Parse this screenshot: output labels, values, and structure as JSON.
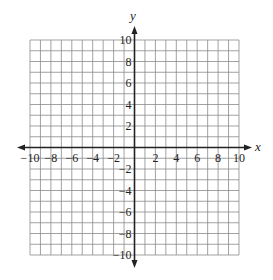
{
  "chart_data": {
    "type": "coordinate-grid",
    "title": "",
    "xlabel": "x",
    "ylabel": "y",
    "xlim": [
      -10,
      10
    ],
    "ylim": [
      -10,
      10
    ],
    "grid": true,
    "grid_step": 1,
    "x_ticks": [
      "-10",
      "-8",
      "-6",
      "-4",
      "-2",
      "2",
      "4",
      "6",
      "8",
      "10"
    ],
    "y_ticks": [
      "10",
      "8",
      "6",
      "4",
      "2",
      "-2",
      "-4",
      "-6",
      "-8",
      "-10"
    ],
    "series": []
  },
  "colors": {
    "grid": "#8a8a8a",
    "axis": "#222222",
    "background": "#ffffff"
  }
}
